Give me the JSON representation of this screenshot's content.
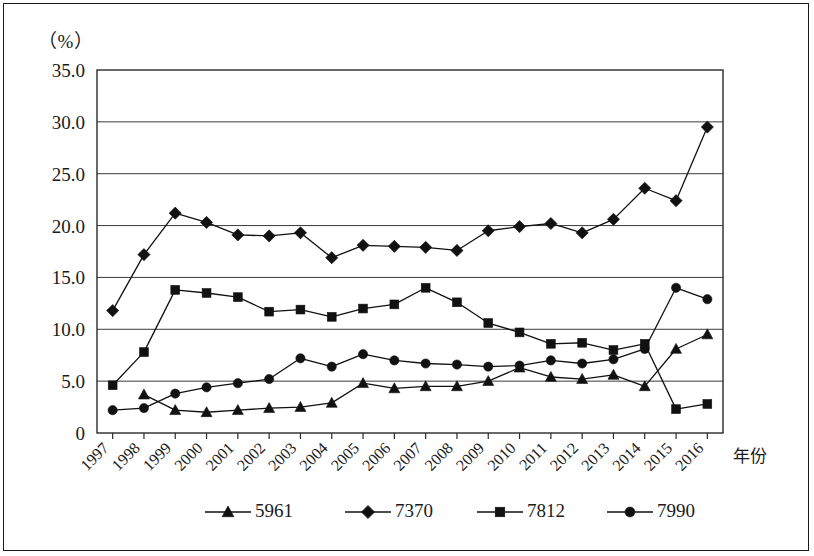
{
  "figure": {
    "unit_label": "（%）",
    "x_axis_name": "年份"
  },
  "chart_data": {
    "type": "line",
    "title": "",
    "xlabel": "年份",
    "ylabel": "（%）",
    "ylim": [
      0,
      35
    ],
    "ytick_labels": [
      "0",
      "5.0",
      "10.0",
      "15.0",
      "20.0",
      "25.0",
      "30.0",
      "35.0"
    ],
    "ytick_values": [
      0,
      5,
      10,
      15,
      20,
      25,
      30,
      35
    ],
    "grid": true,
    "legend_position": "bottom",
    "categories": [
      "1997",
      "1998",
      "1999",
      "2000",
      "2001",
      "2002",
      "2003",
      "2004",
      "2005",
      "2006",
      "2007",
      "2008",
      "2009",
      "2010",
      "2011",
      "2012",
      "2013",
      "2014",
      "2015",
      "2016"
    ],
    "x": [
      1997,
      1998,
      1999,
      2000,
      2001,
      2002,
      2003,
      2004,
      2005,
      2006,
      2007,
      2008,
      2009,
      2010,
      2011,
      2012,
      2013,
      2014,
      2015,
      2016
    ],
    "series": [
      {
        "name": "5961",
        "marker": "triangle",
        "values": [
          null,
          3.7,
          2.2,
          2.0,
          2.2,
          2.4,
          2.5,
          2.9,
          4.8,
          4.3,
          4.5,
          4.5,
          5.0,
          6.3,
          5.4,
          5.2,
          5.6,
          4.5,
          8.1,
          9.5
        ]
      },
      {
        "name": "7370",
        "marker": "diamond",
        "values": [
          11.8,
          17.2,
          21.2,
          20.3,
          19.1,
          19.0,
          19.3,
          16.9,
          18.1,
          18.0,
          17.9,
          17.6,
          19.5,
          19.9,
          20.2,
          19.3,
          20.6,
          23.6,
          22.4,
          29.5
        ]
      },
      {
        "name": "7812",
        "marker": "square",
        "values": [
          4.6,
          7.8,
          13.8,
          13.5,
          13.1,
          11.7,
          11.9,
          11.2,
          12.0,
          12.4,
          14.0,
          12.6,
          10.6,
          9.7,
          8.6,
          8.7,
          8.0,
          8.6,
          2.3,
          2.8
        ]
      },
      {
        "name": "7990",
        "marker": "circle",
        "values": [
          2.2,
          2.4,
          3.8,
          4.4,
          4.8,
          5.2,
          7.2,
          6.4,
          7.6,
          7.0,
          6.7,
          6.6,
          6.4,
          6.5,
          7.0,
          6.7,
          7.1,
          8.1,
          14.0,
          12.9
        ]
      }
    ],
    "legend": [
      {
        "label": "5961",
        "marker": "triangle"
      },
      {
        "label": "7370",
        "marker": "diamond"
      },
      {
        "label": "7812",
        "marker": "square"
      },
      {
        "label": "7990",
        "marker": "circle"
      }
    ]
  }
}
